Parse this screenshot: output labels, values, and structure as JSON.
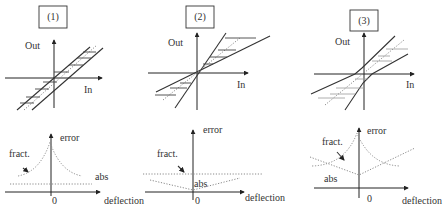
{
  "figure": {
    "panels": [
      {
        "id": "1",
        "label": "(1)",
        "transfer": {
          "y_label": "Out",
          "x_label": "In",
          "description": "parallel offset lines (constant absolute error band)"
        },
        "error_plot": {
          "y_label": "error",
          "x_label": "deflection",
          "origin_label": "0",
          "curve_labels": {
            "fractional": "fract.",
            "absolute": "abs"
          }
        }
      },
      {
        "id": "2",
        "label": "(2)",
        "transfer": {
          "y_label": "Out",
          "x_label": "In",
          "description": "lines through origin with different slopes (constant fractional error)"
        },
        "error_plot": {
          "y_label": "error",
          "x_label": "deflection",
          "origin_label": "0",
          "curve_labels": {
            "fractional": "fract.",
            "absolute": "abs"
          }
        }
      },
      {
        "id": "3",
        "label": "(3)",
        "transfer": {
          "y_label": "Out",
          "x_label": "In",
          "description": "combined offset and slope error band"
        },
        "error_plot": {
          "y_label": "error",
          "x_label": "deflection",
          "origin_label": "0",
          "curve_labels": {
            "fractional": "fract.",
            "absolute": "abs"
          }
        }
      }
    ]
  },
  "colors": {
    "ink": "#333333",
    "dotted": "#8a8a8a",
    "background": "#ffffff"
  }
}
